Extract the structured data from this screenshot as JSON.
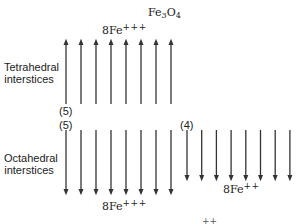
{
  "title": {
    "base": "Fe",
    "sub1": "3",
    "mid": "O",
    "sub2": "4"
  },
  "tetrahedral": {
    "label_line1": "Tetrahedral",
    "label_line2": "interstices",
    "ion": {
      "count": "8",
      "element": "Fe",
      "charge": "+++"
    },
    "moment": "(5)",
    "arrow_direction": "up",
    "arrow_count": 8
  },
  "octahedral": {
    "label_line1": "Octahedral",
    "label_line2": "interstices",
    "fe3": {
      "ion": {
        "count": "8",
        "element": "Fe",
        "charge": "+++"
      },
      "moment": "(5)",
      "arrow_direction": "down",
      "arrow_count": 8
    },
    "fe2": {
      "ion": {
        "count": "8",
        "element": "Fe",
        "charge": "++"
      },
      "moment": "(4)",
      "arrow_direction": "down",
      "arrow_count": 8
    }
  },
  "cutoff_fragment": "++",
  "colors": {
    "arrow": "#333333",
    "text": "#222222",
    "background": "#ffffff"
  }
}
